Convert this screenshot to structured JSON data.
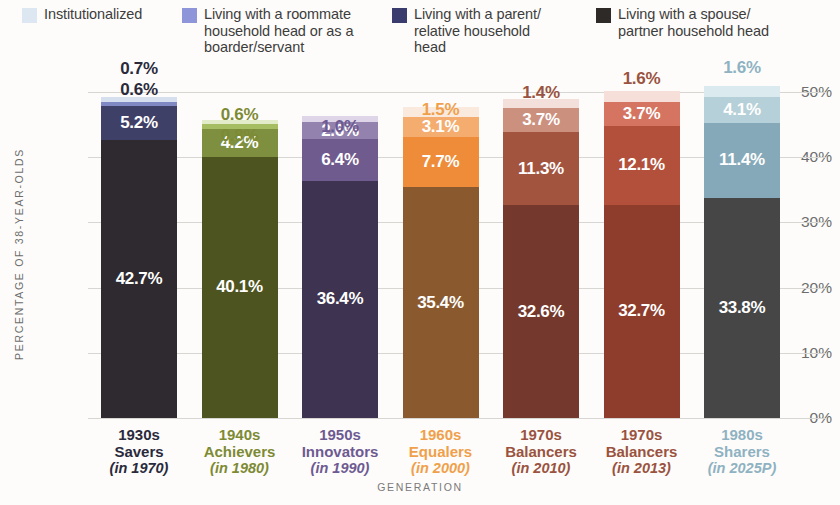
{
  "legend": {
    "items": [
      {
        "label": "Institutionalized",
        "color": "#dde7f2",
        "icon": "legend-swatch-institutionalized"
      },
      {
        "label": "Living with a roommate\nhousehold head or as a\nboarder/servant",
        "color": "#8e95d8",
        "icon": "legend-swatch-roommate"
      },
      {
        "label": "Living with a parent/\nrelative household head",
        "color": "#3b3c6e",
        "icon": "legend-swatch-parent"
      },
      {
        "label": "Living with a spouse/\npartner household head",
        "color": "#2e2a28",
        "icon": "legend-swatch-spouse"
      }
    ]
  },
  "axes": {
    "ylabel": "PERCENTAGE OF 38-YEAR-OLDS",
    "xlabel": "GENERATION",
    "yticks": [
      "0%",
      "10%",
      "20%",
      "30%",
      "40%",
      "50%"
    ]
  },
  "chart_data": {
    "type": "bar",
    "subtype": "stacked-bar",
    "title": "",
    "xlabel": "GENERATION",
    "ylabel": "PERCENTAGE OF 38-YEAR-OLDS",
    "ylim": [
      0,
      50
    ],
    "ytick_values": [
      0,
      10,
      20,
      30,
      40,
      50
    ],
    "grid": true,
    "legend_position": "top",
    "categories": [
      "1930s Savers (in 1970)",
      "1940s Achievers (in 1980)",
      "1950s Innovators (in 1990)",
      "1960s Equalers (in 2000)",
      "1970s Balancers (in 2010)",
      "1970s Balancers (in 2013)",
      "1980s Sharers (in 2025P)"
    ],
    "series": [
      {
        "name": "Living with a spouse/partner household head",
        "values": [
          42.7,
          40.1,
          36.4,
          35.4,
          32.6,
          32.7,
          33.8
        ]
      },
      {
        "name": "Living with a parent/relative household head",
        "values": [
          5.2,
          4.2,
          6.4,
          7.7,
          11.3,
          12.1,
          11.4
        ]
      },
      {
        "name": "Living with a roommate household head or as a boarder/servant",
        "values": [
          0.6,
          0.8,
          2.6,
          3.1,
          3.7,
          3.7,
          4.1
        ]
      },
      {
        "name": "Institutionalized",
        "values": [
          0.7,
          0.6,
          1.0,
          1.5,
          1.4,
          1.6,
          1.6
        ]
      }
    ],
    "totals": [
      49.2,
      45.7,
      46.4,
      47.7,
      49.0,
      50.1,
      50.9
    ]
  },
  "bars": [
    {
      "name": "1930s Savers",
      "year": "(in 1970)",
      "label_color": "#2a2a3c",
      "segments": [
        {
          "key": "spouse",
          "value": "42.7%",
          "pct": 42.7,
          "color": "#2e2a2f",
          "inside": true,
          "text_color": "#ffffff"
        },
        {
          "key": "parent",
          "value": "5.2%",
          "pct": 5.2,
          "color": "#3f4068",
          "inside": true,
          "text_color": "#ffffff"
        },
        {
          "key": "roommate",
          "value": "0.6%",
          "pct": 0.6,
          "color": "#8189c4",
          "inside": false,
          "text_color": "#2a2a3c"
        },
        {
          "key": "institutionalized",
          "value": "0.7%",
          "pct": 0.7,
          "color": "#d5dfee",
          "inside": false,
          "text_color": "#2a2a3c"
        }
      ]
    },
    {
      "name": "1940s Achievers",
      "year": "(in 1980)",
      "label_color": "#7d8a34",
      "segments": [
        {
          "key": "spouse",
          "value": "40.1%",
          "pct": 40.1,
          "color": "#4e5420",
          "inside": true,
          "text_color": "#ffffff"
        },
        {
          "key": "parent",
          "value": "4.2%",
          "pct": 4.2,
          "color": "#7e9040",
          "inside": true,
          "text_color": "#ffffff"
        },
        {
          "key": "roommate",
          "value": "0.8%",
          "pct": 0.8,
          "color": "#a7bd62",
          "inside": false,
          "text_color": "#7d8a34"
        },
        {
          "key": "institutionalized",
          "value": "0.6%",
          "pct": 0.6,
          "color": "#e2ecc9",
          "inside": false,
          "text_color": "#7d8a34"
        }
      ]
    },
    {
      "name": "1950s Innovators",
      "year": "(in 1990)",
      "label_color": "#6e5a92",
      "segments": [
        {
          "key": "spouse",
          "value": "36.4%",
          "pct": 36.4,
          "color": "#3e3350",
          "inside": true,
          "text_color": "#ffffff"
        },
        {
          "key": "parent",
          "value": "6.4%",
          "pct": 6.4,
          "color": "#6f5b8e",
          "inside": true,
          "text_color": "#ffffff"
        },
        {
          "key": "roommate",
          "value": "2.6%",
          "pct": 2.6,
          "color": "#9382ad",
          "inside": true,
          "text_color": "#ffffff"
        },
        {
          "key": "institutionalized",
          "value": "1.0%",
          "pct": 1.0,
          "color": "#ded6e8",
          "inside": false,
          "text_color": "#6e5a92"
        }
      ]
    },
    {
      "name": "1960s Equalers",
      "year": "(in 2000)",
      "label_color": "#f0a04b",
      "segments": [
        {
          "key": "spouse",
          "value": "35.4%",
          "pct": 35.4,
          "color": "#8a5a2e",
          "inside": true,
          "text_color": "#ffffff"
        },
        {
          "key": "parent",
          "value": "7.7%",
          "pct": 7.7,
          "color": "#ef8c3a",
          "inside": true,
          "text_color": "#ffffff"
        },
        {
          "key": "roommate",
          "value": "3.1%",
          "pct": 3.1,
          "color": "#f4ac6f",
          "inside": true,
          "text_color": "#ffffff"
        },
        {
          "key": "institutionalized",
          "value": "1.5%",
          "pct": 1.5,
          "color": "#faeade",
          "inside": false,
          "text_color": "#f0a04b"
        }
      ]
    },
    {
      "name": "1970s Balancers",
      "year": "(in 2010)",
      "label_color": "#9a5340",
      "segments": [
        {
          "key": "spouse",
          "value": "32.6%",
          "pct": 32.6,
          "color": "#74392c",
          "inside": true,
          "text_color": "#ffffff"
        },
        {
          "key": "parent",
          "value": "11.3%",
          "pct": 11.3,
          "color": "#a3543f",
          "inside": true,
          "text_color": "#ffffff"
        },
        {
          "key": "roommate",
          "value": "3.7%",
          "pct": 3.7,
          "color": "#cc907f",
          "inside": true,
          "text_color": "#ffffff"
        },
        {
          "key": "institutionalized",
          "value": "1.4%",
          "pct": 1.4,
          "color": "#f3e0db",
          "inside": false,
          "text_color": "#9a5340"
        }
      ]
    },
    {
      "name": "1970s Balancers",
      "year": "(in 2013)",
      "label_color": "#9a5340",
      "segments": [
        {
          "key": "spouse",
          "value": "32.7%",
          "pct": 32.7,
          "color": "#8e3c2c",
          "inside": true,
          "text_color": "#ffffff"
        },
        {
          "key": "parent",
          "value": "12.1%",
          "pct": 12.1,
          "color": "#b2503b",
          "inside": true,
          "text_color": "#ffffff"
        },
        {
          "key": "roommate",
          "value": "3.7%",
          "pct": 3.7,
          "color": "#d47461",
          "inside": true,
          "text_color": "#ffffff"
        },
        {
          "key": "institutionalized",
          "value": "1.6%",
          "pct": 1.6,
          "color": "#f6dfd9",
          "inside": false,
          "text_color": "#9a5340"
        }
      ]
    },
    {
      "name": "1980s Sharers",
      "year": "(in 2025P)",
      "label_color": "#8fb2c2",
      "segments": [
        {
          "key": "spouse",
          "value": "33.8%",
          "pct": 33.8,
          "color": "#464646",
          "inside": true,
          "text_color": "#ffffff"
        },
        {
          "key": "parent",
          "value": "11.4%",
          "pct": 11.4,
          "color": "#85a9b9",
          "inside": true,
          "text_color": "#ffffff"
        },
        {
          "key": "roommate",
          "value": "4.1%",
          "pct": 4.1,
          "color": "#b5d0d8",
          "inside": true,
          "text_color": "#ffffff"
        },
        {
          "key": "institutionalized",
          "value": "1.6%",
          "pct": 1.6,
          "color": "#dbeaee",
          "inside": false,
          "text_color": "#8fb2c2"
        }
      ]
    }
  ]
}
